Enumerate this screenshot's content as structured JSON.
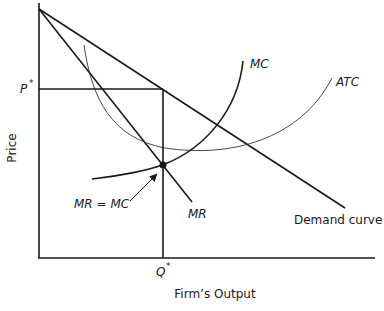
{
  "diagram": {
    "axes": {
      "y_label": "Price",
      "x_label": "Firm’s Output"
    },
    "markers": {
      "price": "P",
      "price_star": "*",
      "quantity": "Q",
      "quantity_star": "*"
    },
    "curves": {
      "mc": "MC",
      "atc": "ATC",
      "mr": "MR",
      "demand": "Demand curve"
    },
    "annotation": "MR = MC",
    "colors": {
      "line": "#1a1a1a",
      "thin_line": "#333333",
      "background": "#ffffff"
    }
  }
}
